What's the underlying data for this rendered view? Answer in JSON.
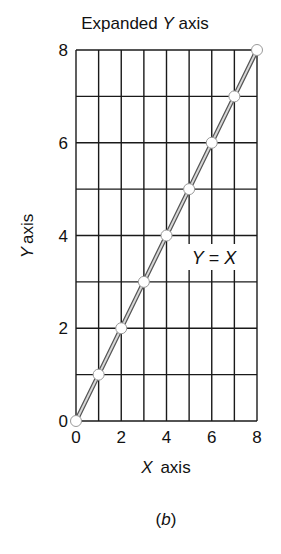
{
  "chart_data": {
    "type": "line",
    "title": "Expanded Y axis",
    "title_parts": {
      "prefix": "Expanded ",
      "italic": "Y",
      "suffix": " axis"
    },
    "xlabel": "X axis",
    "xlabel_parts": {
      "italic": "X",
      "suffix": " axis"
    },
    "ylabel": "Y axis",
    "ylabel_parts": {
      "italic": "Y",
      "suffix": "axis"
    },
    "xlim": [
      0,
      8
    ],
    "ylim": [
      0,
      8
    ],
    "x_ticks": [
      "0",
      "2",
      "4",
      "6",
      "8"
    ],
    "y_ticks": [
      "0",
      "2",
      "4",
      "6",
      "8"
    ],
    "grid": true,
    "x": [
      0,
      1,
      2,
      3,
      4,
      5,
      6,
      7,
      8
    ],
    "series": [
      {
        "name": "Y = X",
        "values": [
          0,
          1,
          2,
          3,
          4,
          5,
          6,
          7,
          8
        ]
      }
    ],
    "annotation": {
      "text": "Y = X",
      "parts": {
        "lhs": "Y",
        "eq": " = ",
        "rhs": "X"
      },
      "x": 5.6,
      "y": 3.4
    },
    "caption": "(b)",
    "caption_parts": {
      "open": "(",
      "italic": "b",
      "close": ")"
    }
  }
}
